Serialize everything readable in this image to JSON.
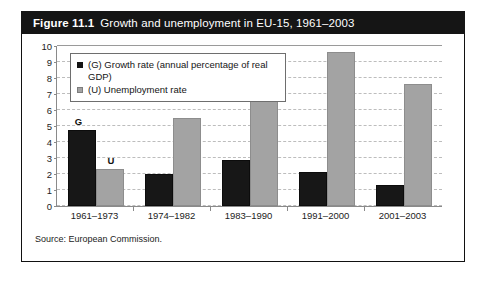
{
  "figure": {
    "number": "Figure 11.1",
    "title": "Growth and unemployment in EU-15, 1961–2003",
    "source": "Source: European Commission."
  },
  "legend": {
    "growth_label": "(G) Growth rate (annual percentage of real GDP)",
    "unemployment_label": "(U) Unemployment rate",
    "growth_swatch_color": "#141414",
    "unemployment_swatch_color": "#a3a3a3"
  },
  "annotations": {
    "growth_marker": "G",
    "unemployment_marker": "U"
  },
  "yticks": [
    "10",
    "9",
    "8",
    "7",
    "6",
    "5",
    "4",
    "3",
    "2",
    "1",
    "0"
  ],
  "chart_data": {
    "type": "bar",
    "title": "Growth and unemployment in EU-15, 1961–2003",
    "xlabel": "",
    "ylabel": "",
    "ylim": [
      0,
      10
    ],
    "yticks": [
      0,
      1,
      2,
      3,
      4,
      5,
      6,
      7,
      8,
      9,
      10
    ],
    "grid": true,
    "legend_position": "upper-left-inside",
    "categories": [
      "1961–1973",
      "1974–1982",
      "1983–1990",
      "1991–2000",
      "2001–2003"
    ],
    "series": [
      {
        "name": "(G) Growth rate (annual percentage of real GDP)",
        "color": "#171717",
        "values": [
          4.75,
          2.0,
          2.9,
          2.1,
          1.3
        ]
      },
      {
        "name": "(U) Unemployment rate",
        "color": "#a3a3a3",
        "values": [
          2.3,
          5.5,
          9.0,
          9.6,
          7.6
        ]
      }
    ],
    "annotations": [
      {
        "text": "G",
        "category": "1961–1973",
        "series": "(G) Growth rate (annual percentage of real GDP)"
      },
      {
        "text": "U",
        "category": "1961–1973",
        "series": "(U) Unemployment rate"
      }
    ]
  }
}
